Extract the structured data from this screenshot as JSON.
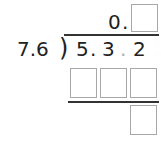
{
  "problem": {
    "quotient_prefix": "0",
    "quotient_point": ".",
    "divisor": "7.6",
    "bracket": ")",
    "dividend_digits": [
      "5",
      "3",
      "2"
    ],
    "dividend_points": [
      ".",
      "."
    ],
    "answer_boxes": {
      "quotient": [
        ""
      ],
      "partial_product": [
        "",
        "",
        ""
      ],
      "remainder": [
        ""
      ]
    }
  },
  "colors": {
    "text": "#222222",
    "box_border": "#a8a8a8",
    "shifted_point": "#b0b0b0",
    "rule": "#333333"
  }
}
